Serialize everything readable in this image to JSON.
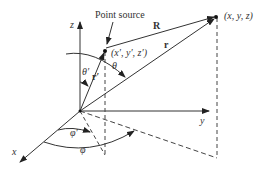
{
  "labels": {
    "point_source": "Point source",
    "R": "R",
    "r": "r",
    "r_prime": "r′",
    "field_point": "(x, y, z)",
    "source_point": "(x′, y′, z′)",
    "theta": "θ",
    "theta_prime": "θ′",
    "phi": "φ",
    "phi_prime": "φ′",
    "x": "x",
    "y": "y",
    "z": "z"
  }
}
